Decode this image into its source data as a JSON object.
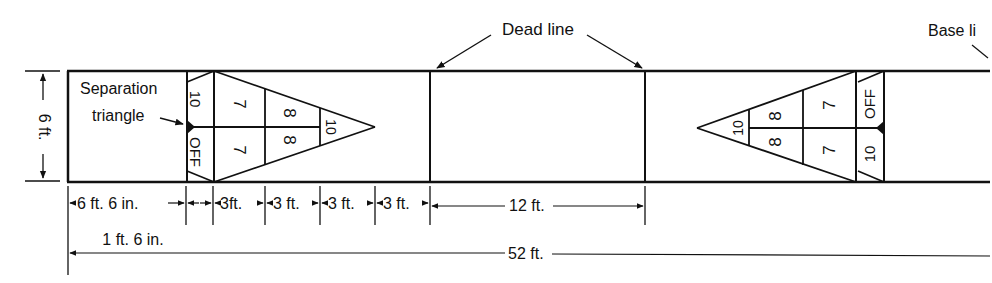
{
  "diagram": {
    "colors": {
      "ink": "#111111",
      "background": "#ffffff"
    },
    "callouts": {
      "dead_line": "Dead line",
      "base_line": "Base li",
      "separation_triangle_line1": "Separation",
      "separation_triangle_line2": "triangle"
    },
    "court_width_label": "6 ft.",
    "left_scoring": {
      "strip_top": "10",
      "strip_bottom": "OFF",
      "row1_top": "7",
      "row1_bottom": "7",
      "row2_top": "8",
      "row2_bottom": "8",
      "tip": "10"
    },
    "right_scoring": {
      "strip_top": "OFF",
      "strip_bottom": "10",
      "row1_top": "7",
      "row1_bottom": "7",
      "row2_top": "8",
      "row2_bottom": "8",
      "tip": "10"
    },
    "dimensions": {
      "d1": "6 ft. 6 in.",
      "d2": "1 ft. 6 in.",
      "d3": "3ft.",
      "d4": "3 ft.",
      "d5": "3 ft.",
      "d6": "3 ft.",
      "d7": "12 ft.",
      "total": "52 ft."
    }
  }
}
